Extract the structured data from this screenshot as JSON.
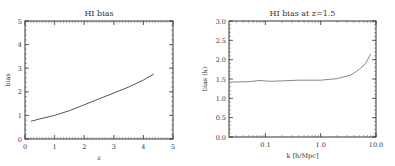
{
  "chart_data": [
    {
      "type": "line",
      "title": "HI bias",
      "xlabel": "z",
      "ylabel": "bias",
      "xlim": [
        0,
        5
      ],
      "ylim": [
        0,
        5
      ],
      "xticks": [
        "0",
        "1",
        "2",
        "3",
        "4",
        "5"
      ],
      "yticks": [
        "0",
        "1",
        "2",
        "3",
        "4",
        "5"
      ],
      "grid": false,
      "legend": null,
      "series": [
        {
          "name": "HI bias",
          "x": [
            0.2,
            0.5,
            1.0,
            1.5,
            2.0,
            2.5,
            3.0,
            3.5,
            4.0,
            4.35
          ],
          "y": [
            0.75,
            0.85,
            1.0,
            1.2,
            1.45,
            1.7,
            1.95,
            2.2,
            2.5,
            2.75
          ]
        }
      ],
      "color": "#555555"
    },
    {
      "type": "line",
      "title": "HI bias at z=1.5",
      "xlabel": "k [h/Mpc]",
      "ylabel": "bias (k)",
      "xscale": "log",
      "xlim": [
        0.022,
        10.0
      ],
      "ylim": [
        0.0,
        3.0
      ],
      "xticks": [
        "0.1",
        "1.0",
        "10.0"
      ],
      "yticks": [
        "0.0",
        "0.5",
        "1.0",
        "1.5",
        "2.0",
        "2.5",
        "3.0"
      ],
      "grid": false,
      "legend": null,
      "series": [
        {
          "name": "HI bias at z=1.5",
          "x": [
            0.022,
            0.05,
            0.08,
            0.12,
            0.2,
            0.4,
            1.0,
            2.0,
            3.5,
            5.0,
            6.5,
            8.0
          ],
          "y": [
            1.42,
            1.43,
            1.46,
            1.44,
            1.45,
            1.47,
            1.47,
            1.51,
            1.6,
            1.75,
            1.9,
            2.15
          ]
        }
      ],
      "color": "#888888"
    }
  ]
}
